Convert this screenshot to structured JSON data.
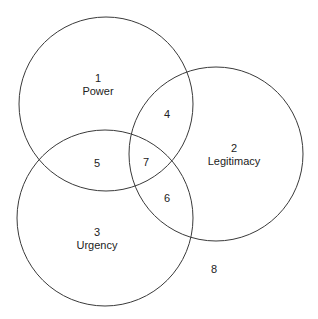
{
  "diagram": {
    "type": "venn",
    "stroke_color": "#3a3a3a",
    "circles": [
      {
        "id": "power",
        "cx": 106,
        "cy": 104,
        "r": 87
      },
      {
        "id": "legitimacy",
        "cx": 216,
        "cy": 154,
        "r": 87
      },
      {
        "id": "urgency",
        "cx": 105,
        "cy": 218,
        "r": 88
      }
    ],
    "regions": [
      {
        "number": "1",
        "label": "Power"
      },
      {
        "number": "2",
        "label": "Legitimacy"
      },
      {
        "number": "3",
        "label": "Urgency"
      },
      {
        "number": "4",
        "label": ""
      },
      {
        "number": "5",
        "label": ""
      },
      {
        "number": "6",
        "label": ""
      },
      {
        "number": "7",
        "label": ""
      },
      {
        "number": "8",
        "label": ""
      }
    ]
  }
}
